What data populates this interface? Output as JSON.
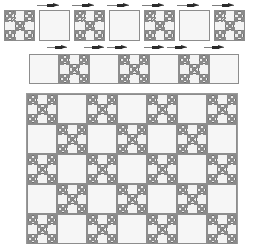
{
  "figure": {
    "background_color": "#ffffff",
    "line_color": "#8d8d8d",
    "fill_light": "#f6f6f6",
    "fill_fractal": "#ececec",
    "arrow_color": "#2b2b2b"
  },
  "rows": {
    "top": {
      "name": "top-row",
      "y": 10,
      "tile_size": 31,
      "gap": 4,
      "start_x": 4,
      "count": 7,
      "pattern": [
        "fractal",
        "empty",
        "fractal",
        "empty",
        "fractal",
        "empty",
        "fractal"
      ],
      "arrows": [
        {
          "x": 37,
          "y": 3,
          "width": 22
        },
        {
          "x": 72,
          "y": 3,
          "width": 22
        },
        {
          "x": 107,
          "y": 3,
          "width": 22
        },
        {
          "x": 142,
          "y": 3,
          "width": 22
        },
        {
          "x": 177,
          "y": 3,
          "width": 22
        },
        {
          "x": 212,
          "y": 3,
          "width": 22
        }
      ]
    },
    "middle": {
      "name": "middle-row",
      "y": 54,
      "tile_size": 30,
      "gap": 0,
      "start_x": 29,
      "count": 7,
      "pattern": [
        "empty",
        "fractal",
        "empty",
        "fractal",
        "empty",
        "fractal",
        "empty"
      ],
      "arrows": [
        {
          "x": 47,
          "y": 45,
          "width": 20
        },
        {
          "x": 84,
          "y": 45,
          "width": 20
        },
        {
          "x": 107,
          "y": 45,
          "width": 20
        },
        {
          "x": 144,
          "y": 45,
          "width": 20
        },
        {
          "x": 167,
          "y": 45,
          "width": 20
        },
        {
          "x": 204,
          "y": 45,
          "width": 20
        }
      ]
    }
  },
  "grid": {
    "name": "main-checkerboard-grid",
    "x": 26,
    "y": 93,
    "cell_size": 30,
    "cols": 7,
    "rows": 5,
    "start_type": "fractal",
    "pattern": [
      [
        "fractal",
        "empty",
        "fractal",
        "empty",
        "fractal",
        "empty",
        "fractal"
      ],
      [
        "empty",
        "fractal",
        "empty",
        "fractal",
        "empty",
        "fractal",
        "empty"
      ],
      [
        "fractal",
        "empty",
        "fractal",
        "empty",
        "fractal",
        "empty",
        "fractal"
      ],
      [
        "empty",
        "fractal",
        "empty",
        "fractal",
        "empty",
        "fractal",
        "empty"
      ],
      [
        "fractal",
        "empty",
        "fractal",
        "empty",
        "fractal",
        "empty",
        "fractal"
      ]
    ]
  },
  "fractal": {
    "name": "sierpinski-carpet-tile",
    "depth": 3,
    "subdivisions": 3,
    "occupied_cells": [
      [
        0,
        0
      ],
      [
        0,
        2
      ],
      [
        1,
        1
      ],
      [
        2,
        0
      ],
      [
        2,
        2
      ]
    ],
    "description": "3x3 subdivision keeping four corners and the center, recursed"
  }
}
